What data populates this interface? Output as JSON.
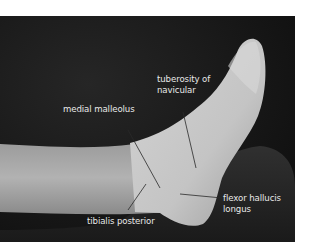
{
  "figure": {
    "background_color": "#141414",
    "skin_color": "#bdbdbd",
    "label_color": "#e8e8e8",
    "labels": [
      {
        "text_line1": "tuberosity of",
        "text_line2": "navicular"
      },
      {
        "text_line1": "medial malleolus"
      },
      {
        "text_line1": "flexor hallucis",
        "text_line2": "longus"
      },
      {
        "text_line1": "tibialis posterior"
      }
    ]
  }
}
